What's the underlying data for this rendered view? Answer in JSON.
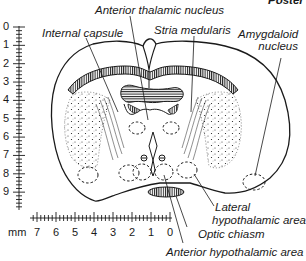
{
  "corner_text": "Poster",
  "labels": {
    "anterior_thalamic_nucleus": "Anterior thalamic nucleus",
    "internal_capsule": "Internal capsule",
    "stria_medullaris": "Stria medularis",
    "amygdaloid_nucleus_line1": "Amygdaloid",
    "amygdaloid_nucleus_line2": "nucleus",
    "lateral_hypothalamic_line1": "Lateral",
    "lateral_hypothalamic_line2": "hypothalamic area",
    "optic_chiasm": "Optic chiasm",
    "anterior_hypothalamic_area": "Anterior hypothalamic area"
  },
  "vertical_scale": {
    "ticks": [
      "0",
      "1",
      "2",
      "3",
      "4",
      "5",
      "6",
      "7",
      "8",
      "9"
    ]
  },
  "horizontal_scale": {
    "unit": "mm",
    "ticks": [
      "7",
      "6",
      "5",
      "4",
      "3",
      "2",
      "1",
      "0"
    ]
  },
  "colors": {
    "ink": "#1a1a1a",
    "background": "#ffffff"
  }
}
